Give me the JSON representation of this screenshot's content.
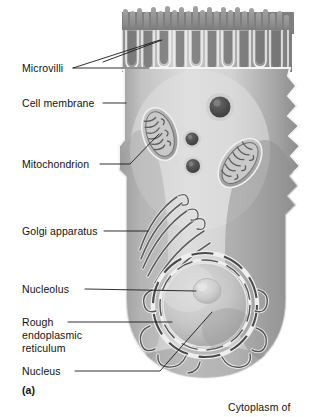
{
  "figure": {
    "title_caption": "(a)",
    "style": "grayscale airbrush biology textbook illustration"
  },
  "labels": {
    "microvilli": "Microvilli",
    "cell_membrane": "Cell membrane",
    "mitochondrion": "Mitochondrion",
    "golgi_apparatus": "Golgi apparatus",
    "nucleolus": "Nucleolus",
    "rough_er_line1": "Rough",
    "rough_er_line2": "endoplasmic",
    "rough_er_line3": "reticulum",
    "nucleus": "Nucleus",
    "panel_letter": "(a)",
    "cytoplasm_of": "Cytoplasm of"
  },
  "colors": {
    "background": "#ffffff",
    "text": "#121212",
    "leader_line": "#1a1a1a",
    "cytoplasm_light": "#d8d8d8",
    "cytoplasm_mid": "#b8b8b8",
    "cytoplasm_dark": "#8d8d8d",
    "membrane_highlight": "#f4f4f4",
    "organelle_dark": "#6e6e6e",
    "organelle_shadow": "#4a4a4a",
    "nucleus_fill": "#c9c9c9",
    "nucleolus_fill": "#cfcfcf"
  },
  "structures": [
    {
      "name": "microvilli",
      "count": 13,
      "region": "apical surface"
    },
    {
      "name": "cell-membrane",
      "region": "cell outline"
    },
    {
      "name": "mitochondrion-upper-left",
      "region": "upper cytoplasm"
    },
    {
      "name": "mitochondrion-lower-right",
      "region": "mid cytoplasm"
    },
    {
      "name": "vesicle-large",
      "region": "upper cytoplasm"
    },
    {
      "name": "vesicle-small",
      "region": "mid cytoplasm"
    },
    {
      "name": "vesicle-medium",
      "region": "mid cytoplasm"
    },
    {
      "name": "golgi-apparatus",
      "region": "supranuclear cytoplasm"
    },
    {
      "name": "rough-endoplasmic-reticulum",
      "region": "perinuclear"
    },
    {
      "name": "nucleus",
      "region": "basal cell"
    },
    {
      "name": "nucleolus",
      "region": "inside nucleus"
    }
  ]
}
